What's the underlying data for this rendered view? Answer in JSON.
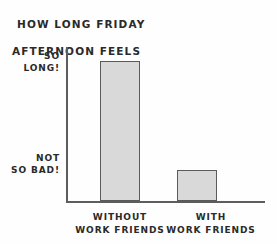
{
  "chart_data": {
    "type": "bar",
    "title": "HOW LONG FRIDAY AFTERNOON FEELS",
    "title_lines": [
      "HOW LONG FRIDAY",
      "AFTERNOON FEELS"
    ],
    "categories": [
      "WITHOUT WORK FRIENDS",
      "WITH WORK FRIENDS"
    ],
    "category_lines": [
      [
        "WITHOUT",
        "WORK FRIENDS"
      ],
      [
        "WITH",
        "WORK FRIENDS"
      ]
    ],
    "values": [
      100,
      22
    ],
    "xlabel": "",
    "ylabel": "",
    "ytick_labels": [
      "SO LONG!",
      "NOT SO BAD!"
    ],
    "ytick_label_lines": [
      [
        "SO",
        "LONG!"
      ],
      [
        "NOT",
        "SO BAD!"
      ]
    ],
    "ytick_values": [
      100,
      22
    ],
    "ylim": [
      0,
      110
    ],
    "grid": false,
    "legend": false,
    "legend_position": "none",
    "style": "hand-drawn",
    "bar_fill_color": "#d9d9d9",
    "bar_border_color": "#5a5a5a",
    "axis_color": "#5d5d5d",
    "text_color": "#2a2a2a",
    "background_color": "#fefefe"
  },
  "title": {
    "line1": "HOW LONG FRIDAY",
    "line2": "AFTERNOON FEELS"
  },
  "y_axis": {
    "high_label_line1": "SO",
    "high_label_line2": "LONG!",
    "low_label_line1": "NOT",
    "low_label_line2": "SO BAD!"
  },
  "x_axis": {
    "cat1_line1": "WITHOUT",
    "cat1_line2": "WORK FRIENDS",
    "cat2_line1": "WITH",
    "cat2_line2": "WORK FRIENDS"
  }
}
